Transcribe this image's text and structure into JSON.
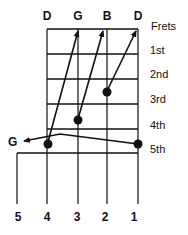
{
  "diagram": {
    "type": "banjo-fret-diagram",
    "open_string_notes": [
      "D",
      "G",
      "B",
      "D"
    ],
    "frets_header": "Frets",
    "fret_labels": [
      "1st",
      "2nd",
      "3rd",
      "4th",
      "5th"
    ],
    "fifth_string_note": "G",
    "string_numbers": [
      "5",
      "4",
      "3",
      "2",
      "1"
    ],
    "dots": [
      {
        "string": "4",
        "fret": "5th"
      },
      {
        "string": "3",
        "fret": "4th"
      },
      {
        "string": "2",
        "fret": "3rd"
      },
      {
        "string": "1",
        "fret": "5th"
      }
    ],
    "arrows": [
      {
        "from": "string 4, 5th fret",
        "to": "open D (string 4)"
      },
      {
        "from": "string 3, 4th fret",
        "to": "open G (string 3)"
      },
      {
        "from": "string 2, 3rd fret",
        "to": "open D (string 1)"
      },
      {
        "from": "string 1, 5th fret",
        "to": "G (string 5)"
      }
    ],
    "colors": {
      "ink": "#111111",
      "background": "#ffffff"
    }
  }
}
